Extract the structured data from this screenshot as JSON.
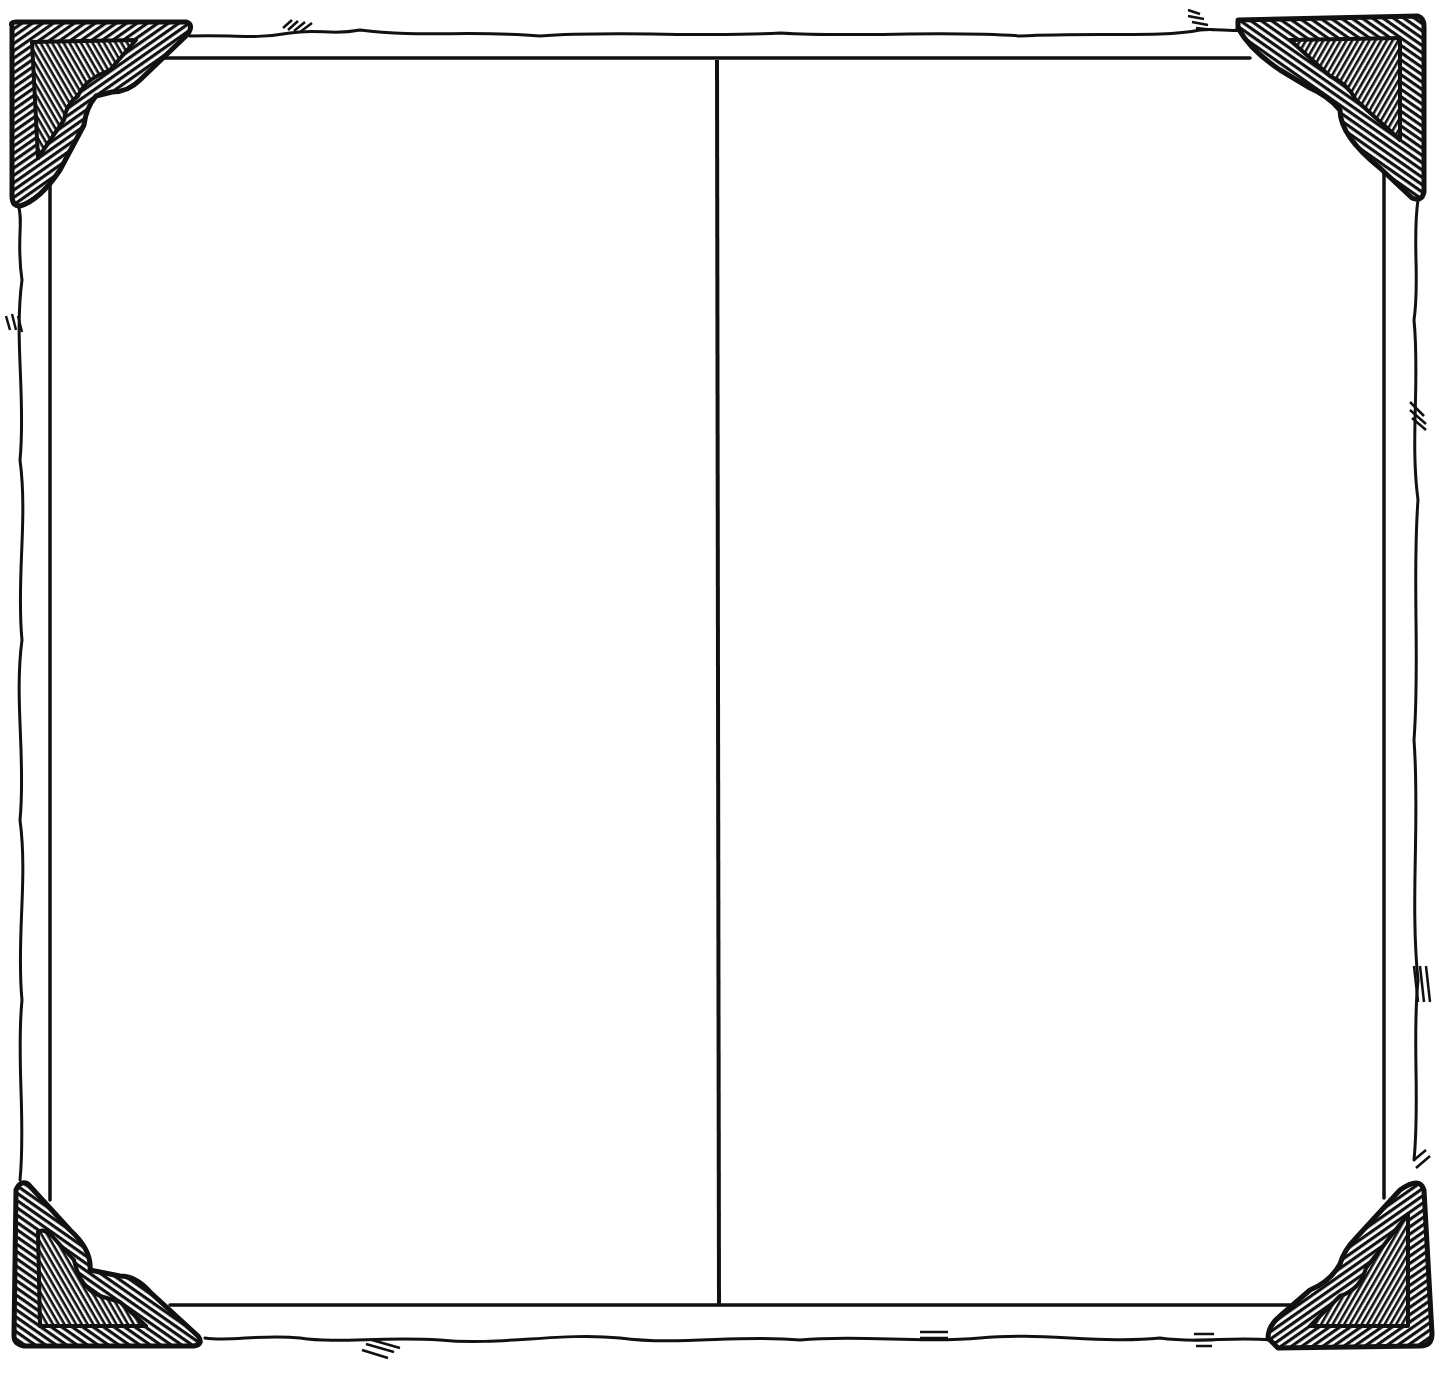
{
  "illustration": {
    "description": "Hand-drawn photo album frame with four hatched corner mounts, a torn/wavy outer paper edge and a vertical divider splitting the inner area into two panels",
    "colors": {
      "background": "#ffffff",
      "ink": "#111111"
    },
    "panels": [
      {
        "id": "left",
        "text": ""
      },
      {
        "id": "right",
        "text": ""
      }
    ],
    "corners": [
      "top-left",
      "top-right",
      "bottom-left",
      "bottom-right"
    ]
  }
}
